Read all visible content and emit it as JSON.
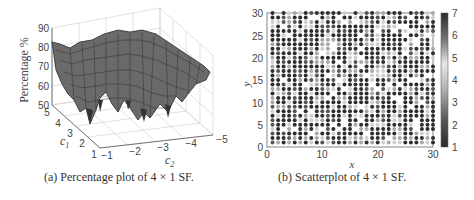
{
  "figure": {
    "panel_a": {
      "caption": "(a)  Percentage plot of 4 × 1 SF.",
      "zlabel": "Percentage %",
      "xlabel": "c2",
      "ylabel": "c1",
      "z_ticks": [
        "90",
        "80",
        "70",
        "60",
        "50"
      ],
      "c1_ticks": [
        "5",
        "4",
        "3",
        "2",
        "1"
      ],
      "c2_ticks": [
        "−1",
        "−2",
        "−3",
        "−4",
        "−5"
      ]
    },
    "panel_b": {
      "caption": "(b)  Scatterplot of 4 × 1 SF.",
      "xlabel": "x",
      "ylabel": "y",
      "x_ticks": [
        "0",
        "10",
        "20",
        "30"
      ],
      "y_ticks": [
        "30",
        "25",
        "20",
        "15",
        "10",
        "5",
        "0"
      ],
      "colorbar_ticks": [
        "7",
        "6",
        "5",
        "4",
        "3",
        "2",
        "1"
      ]
    }
  },
  "chart_data": [
    {
      "type": "surface",
      "title": "(a) Percentage plot of 4 × 1 SF.",
      "xlabel": "c2",
      "ylabel": "c1",
      "zlabel": "Percentage %",
      "xlim": [
        -5,
        -1
      ],
      "ylim": [
        1,
        5
      ],
      "zlim": [
        50,
        90
      ],
      "x_ticks": [
        -1,
        -2,
        -3,
        -4,
        -5
      ],
      "y_ticks": [
        1,
        2,
        3,
        4,
        5
      ],
      "z_ticks": [
        50,
        60,
        70,
        80,
        90
      ],
      "grid": true,
      "description": "Noisy 3D mesh surface; plateau near 75-82% at high c1 / far c2, with deep troughs down to ~52-55% near c1≈1-2 around c2≈-1.5 and c2≈-2.8 to -3.5."
    },
    {
      "type": "scatter",
      "title": "(b) Scatterplot of 4 × 1 SF.",
      "xlabel": "x",
      "ylabel": "y",
      "xlim": [
        0,
        30
      ],
      "ylim": [
        0,
        30
      ],
      "x_ticks": [
        0,
        10,
        20,
        30
      ],
      "y_ticks": [
        0,
        5,
        10,
        15,
        20,
        25,
        30
      ],
      "colorbar": {
        "min": 1,
        "max": 7,
        "ticks": [
          1,
          2,
          3,
          4,
          5,
          6,
          7
        ],
        "colormap": "dark-light-dark grayscale"
      },
      "grid_points": "30 x 30 integer lattice (x=1..30, y=1..30), each point colored by a value 1-7; majority dark (values ~1-2 or ~6-7), with scattered lighter (values ~3-5) points and gaps"
    }
  ]
}
